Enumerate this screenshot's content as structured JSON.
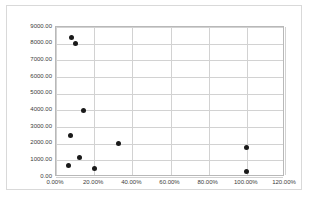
{
  "chart_data": {
    "type": "scatter",
    "title": "",
    "subtitle": "",
    "xlabel": "",
    "ylabel": "",
    "xlim": [
      0,
      1.2
    ],
    "ylim": [
      0,
      9000
    ],
    "grid": true,
    "legend": false,
    "legend_position": "none",
    "marker_color": "#1a1a1a",
    "gridline_color": "#d2d2d2",
    "plot_border_color": "#b8b8b8",
    "frame_border_color": "#d9d9d9",
    "background_color": "#ffffff",
    "x_ticks": [
      0,
      0.2,
      0.4,
      0.6,
      0.8,
      1.0,
      1.2
    ],
    "x_tick_labels": [
      "0.00%",
      "20.00%",
      "40.00%",
      "60.00%",
      "80.00%",
      "100.00%",
      "120.00%"
    ],
    "y_ticks": [
      0,
      1000,
      2000,
      3000,
      4000,
      5000,
      6000,
      7000,
      8000,
      9000
    ],
    "y_tick_labels": [
      "0.00",
      "1000.00",
      "2000.00",
      "3000.00",
      "4000.00",
      "5000.00",
      "6000.00",
      "7000.00",
      "8000.00",
      "9000.00"
    ],
    "points": [
      {
        "x": 0.08,
        "y": 8400
      },
      {
        "x": 0.1,
        "y": 8000
      },
      {
        "x": 0.145,
        "y": 4000
      },
      {
        "x": 0.075,
        "y": 2500
      },
      {
        "x": 0.33,
        "y": 2000
      },
      {
        "x": 1.0,
        "y": 1800
      },
      {
        "x": 0.125,
        "y": 1200
      },
      {
        "x": 0.065,
        "y": 700
      },
      {
        "x": 0.2,
        "y": 500
      },
      {
        "x": 1.0,
        "y": 350
      }
    ]
  }
}
